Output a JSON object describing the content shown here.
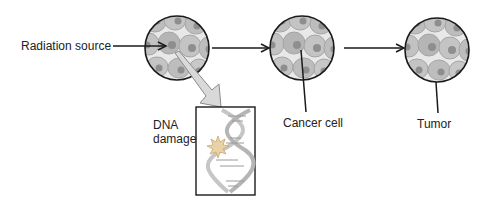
{
  "diagram": {
    "type": "process-flow",
    "stages": [
      {
        "id": "normal-tissue",
        "label": ""
      },
      {
        "id": "cancer-cell",
        "label": "Cancer cell"
      },
      {
        "id": "tumor",
        "label": "Tumor"
      }
    ],
    "labels": {
      "radiation": "Radiation source",
      "dna_damage_line1": "DNA",
      "dna_damage_line2": "damage",
      "cancer_cell": "Cancer cell",
      "tumor": "Tumor"
    },
    "colors": {
      "cell_fill": "#b8b8b8",
      "cell_light": "#cfcfcf",
      "nucleus": "#8e8e8e",
      "outline": "#1a1a1a",
      "arrow_fill": "#d9d9d9",
      "dna_strand": "#c8c8c8"
    }
  }
}
